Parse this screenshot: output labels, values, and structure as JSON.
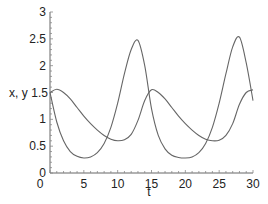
{
  "chart_data": {
    "type": "line",
    "title": "",
    "xlabel": "t",
    "ylabel": "x, y",
    "xlim": [
      0,
      30
    ],
    "ylim": [
      0,
      3
    ],
    "x_ticks": [
      0,
      5,
      10,
      15,
      20,
      25,
      30
    ],
    "y_ticks": [
      0,
      0.5,
      1,
      1.5,
      2,
      2.5,
      3
    ],
    "x_tick_labels": [
      "0",
      "5",
      "10",
      "15",
      "20",
      "25",
      "30"
    ],
    "y_tick_labels": [
      "0",
      "0.5",
      "1",
      "1.5",
      "2",
      "2.5",
      "3"
    ],
    "grid": false,
    "legend": null,
    "line_color": "#666666",
    "series": [
      {
        "name": "x",
        "x": [
          0,
          1,
          2,
          3,
          4,
          5,
          6,
          7,
          8,
          9,
          10,
          11,
          12,
          13,
          14,
          15,
          16,
          17,
          18,
          19,
          20,
          21,
          22,
          23,
          24,
          25,
          26,
          27,
          28,
          29,
          30
        ],
        "values": [
          1.5,
          0.95,
          0.6,
          0.4,
          0.31,
          0.28,
          0.3,
          0.38,
          0.55,
          0.85,
          1.3,
          1.85,
          2.3,
          2.47,
          2.0,
          1.2,
          0.7,
          0.45,
          0.33,
          0.29,
          0.28,
          0.3,
          0.38,
          0.55,
          0.85,
          1.3,
          1.85,
          2.35,
          2.53,
          2.05,
          1.35
        ]
      },
      {
        "name": "y",
        "x": [
          0,
          1,
          2,
          3,
          4,
          5,
          6,
          7,
          8,
          9,
          10,
          11,
          12,
          13,
          14,
          15,
          16,
          17,
          18,
          19,
          20,
          21,
          22,
          23,
          24,
          25,
          26,
          27,
          28,
          29,
          30
        ],
        "values": [
          1.5,
          1.56,
          1.5,
          1.38,
          1.22,
          1.06,
          0.92,
          0.8,
          0.7,
          0.63,
          0.6,
          0.62,
          0.72,
          0.98,
          1.35,
          1.55,
          1.5,
          1.38,
          1.22,
          1.06,
          0.92,
          0.8,
          0.7,
          0.63,
          0.6,
          0.61,
          0.7,
          0.92,
          1.28,
          1.5,
          1.55
        ]
      }
    ]
  }
}
